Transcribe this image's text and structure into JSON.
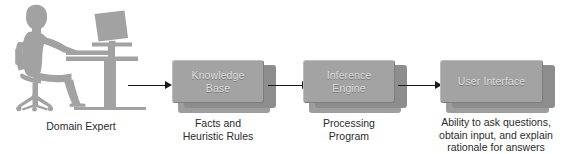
{
  "diagram": {
    "background_color": "#ffffff",
    "box_face_color": "#a3a3a3",
    "box_side_color": "#8d8d8d",
    "box_shadow_color": "#9d9d9d",
    "box_text_color": "#dcdcdc",
    "caption_text_color": "#2b2b2b",
    "arrow_color": "#1a1a1a",
    "silhouette_color": "#a0a0a0"
  },
  "illustration": {
    "name": "person-at-desk-silhouette",
    "caption": "Domain Expert"
  },
  "nodes": [
    {
      "id": "knowledge-base",
      "label": "Knowledge\nBase",
      "caption": "Facts and\nHeuristic Rules"
    },
    {
      "id": "inference-engine",
      "label": "Inference\nEngine",
      "caption": "Processing\nProgram"
    },
    {
      "id": "user-interface",
      "label": "User Interface",
      "caption": "Ability to ask questions,\nobtain input, and explain\nrationale for answers"
    }
  ],
  "arrows": [
    {
      "id": "expert-to-knowledge-base",
      "from": "domain-expert",
      "to": "knowledge-base"
    },
    {
      "id": "knowledge-base-to-inference-engine",
      "from": "knowledge-base",
      "to": "inference-engine"
    },
    {
      "id": "inference-engine-to-user-interface",
      "from": "inference-engine",
      "to": "user-interface"
    }
  ]
}
